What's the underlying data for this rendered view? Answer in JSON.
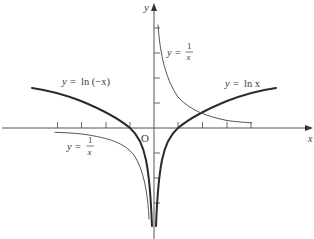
{
  "diagram": {
    "type": "function-graphs",
    "axes": {
      "x_label": "x",
      "y_label": "y",
      "origin_label": "O",
      "x_ticks": [
        -4,
        -3,
        -2,
        -1,
        1,
        2,
        3,
        4
      ],
      "y_ticks": [
        -3,
        -2,
        -1,
        1,
        2,
        3,
        4
      ]
    },
    "curves": [
      {
        "id": "ln-x",
        "label_lhs": "y =",
        "label_rhs": "ln x",
        "style": "thick",
        "domain": [
          0.02,
          5
        ]
      },
      {
        "id": "ln-neg-x",
        "label_lhs": "y =",
        "label_rhs": "ln (−x)",
        "style": "thick",
        "domain": [
          -5,
          -0.02
        ]
      },
      {
        "id": "recip-pos",
        "label_lhs": "y =",
        "num": "1",
        "den": "x",
        "style": "thin",
        "domain": [
          0.16,
          4
        ]
      },
      {
        "id": "recip-neg",
        "label_lhs": "y =",
        "num": "1",
        "den": "x",
        "style": "thin",
        "domain": [
          -4,
          -0.22
        ]
      }
    ],
    "colors": {
      "thick": "#2a2a2a",
      "thin": "#555555",
      "axis": "#555555",
      "text": "#3a3a3a"
    }
  }
}
